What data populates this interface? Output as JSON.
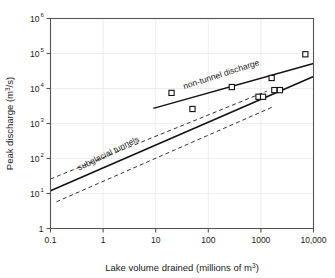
{
  "chart_data": {
    "type": "scatter",
    "title": "",
    "xlabel": "Lake volume drained (millions of m",
    "xlabel_sup": "3",
    "xlabel_tail": ")",
    "ylabel": "Peak discharge (m",
    "ylabel_sup": "3",
    "ylabel_tail": "/s)",
    "xscale": "log",
    "yscale": "log",
    "xlim": [
      0.1,
      10000
    ],
    "ylim": [
      1,
      1000000
    ],
    "grid": true,
    "legend": "none",
    "x_tick_labels": [
      "0.1",
      "1",
      "10",
      "100",
      "1000",
      "10,000"
    ],
    "x_tick_values": [
      0.1,
      1,
      10,
      100,
      1000,
      10000
    ],
    "y_tick_labels": [
      "1",
      "10",
      "10",
      "10",
      "10",
      "10",
      "10"
    ],
    "y_tick_exponents": [
      "",
      "1",
      "2",
      "3",
      "4",
      "5",
      "6"
    ],
    "y_tick_values": [
      1,
      10,
      100,
      1000,
      10000,
      100000,
      1000000
    ],
    "series": [
      {
        "name": "observed floods",
        "marker": "open-square",
        "points": [
          {
            "x": 20,
            "y": 7500
          },
          {
            "x": 50,
            "y": 2600
          },
          {
            "x": 280,
            "y": 11000
          },
          {
            "x": 900,
            "y": 5800
          },
          {
            "x": 1100,
            "y": 5800
          },
          {
            "x": 1600,
            "y": 20000
          },
          {
            "x": 1800,
            "y": 9000
          },
          {
            "x": 2300,
            "y": 9000
          },
          {
            "x": 7000,
            "y": 95000
          }
        ]
      }
    ],
    "trend_lines": [
      {
        "name": "subglacial tunnels",
        "style": "solid",
        "label": "subglacial tunnels",
        "x_start": 0.1,
        "y_start": 12,
        "x_end": 10000,
        "y_end": 22000
      },
      {
        "name": "non-tunnel discharge",
        "style": "solid",
        "label": "non-tunnel discharge",
        "x_start": 9,
        "y_start": 2700,
        "x_end": 10000,
        "y_end": 52000
      }
    ],
    "confidence_bands": [
      {
        "name": "subglacial tunnels upper bound",
        "style": "dashed",
        "x_start": 0.1,
        "y_start": 26,
        "x_end": 1300,
        "y_end": 8400
      },
      {
        "name": "subglacial tunnels lower bound",
        "style": "dashed",
        "x_start": 0.13,
        "y_start": 5.8,
        "x_end": 1700,
        "y_end": 3000
      }
    ],
    "annotations": [
      {
        "text": "subglacial tunnels",
        "x": 0.35,
        "y": 45,
        "rotation": -26
      },
      {
        "text": "non-tunnel discharge",
        "x": 35,
        "y": 9500,
        "rotation": -18
      }
    ]
  }
}
